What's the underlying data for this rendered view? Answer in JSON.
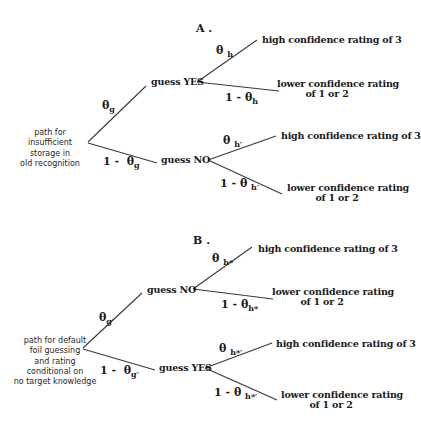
{
  "diagram": {
    "panel_a": {
      "title": "A .",
      "root_label": [
        "path for",
        "insufficient",
        "storage in",
        "old recognition"
      ],
      "branch_upper": {
        "prob_symbol": "θ",
        "prob_sub": "g",
        "node_label": "guess YES",
        "outcome_high": {
          "prob_symbol": "θ",
          "prob_sub": "h",
          "label": "high confidence rating of 3"
        },
        "outcome_low": {
          "prob_prefix": "1 - ",
          "prob_symbol": "θ",
          "prob_sub": "h",
          "label": [
            "lower confidence rating",
            "of 1 or 2"
          ]
        }
      },
      "branch_lower": {
        "prob_prefix": "1 -  ",
        "prob_symbol": "θ",
        "prob_sub": "g",
        "node_label": "guess NO",
        "outcome_high": {
          "prob_symbol": "θ",
          "prob_sub": "h′",
          "label": "high confidence rating of 3"
        },
        "outcome_low": {
          "prob_prefix": "1 - ",
          "prob_symbol": "θ",
          "prob_sub": "h′",
          "label": [
            "lower confidence rating",
            "of 1 or 2"
          ]
        }
      }
    },
    "panel_b": {
      "title": "B .",
      "root_label": [
        "path for default",
        "foil guessing",
        "and rating",
        "conditional on",
        "no target knowledge"
      ],
      "branch_upper": {
        "prob_symbol": "θ",
        "prob_sub": "g′",
        "node_label": "guess NO",
        "outcome_high": {
          "prob_symbol": "θ",
          "prob_sub": "h*",
          "label": "high confidence rating of 3"
        },
        "outcome_low": {
          "prob_prefix": "1 - ",
          "prob_symbol": "θ",
          "prob_sub": "h*",
          "label": [
            "lower confidence rating",
            "of 1 or 2"
          ]
        }
      },
      "branch_lower": {
        "prob_prefix": "1 -  ",
        "prob_symbol": "θ",
        "prob_sub": "g′",
        "node_label": "guess YES",
        "outcome_high": {
          "prob_symbol": "θ",
          "prob_sub": "h*′",
          "label": "high confidence rating of 3"
        },
        "outcome_low": {
          "prob_prefix": "1 - ",
          "prob_symbol": "θ",
          "prob_sub": "h*′",
          "label": [
            "lower confidence rating",
            "of 1 or 2"
          ]
        }
      }
    },
    "colors": {
      "line": "#3a3a3a",
      "text": "#1a1a1a",
      "background": "#ffffff"
    }
  }
}
